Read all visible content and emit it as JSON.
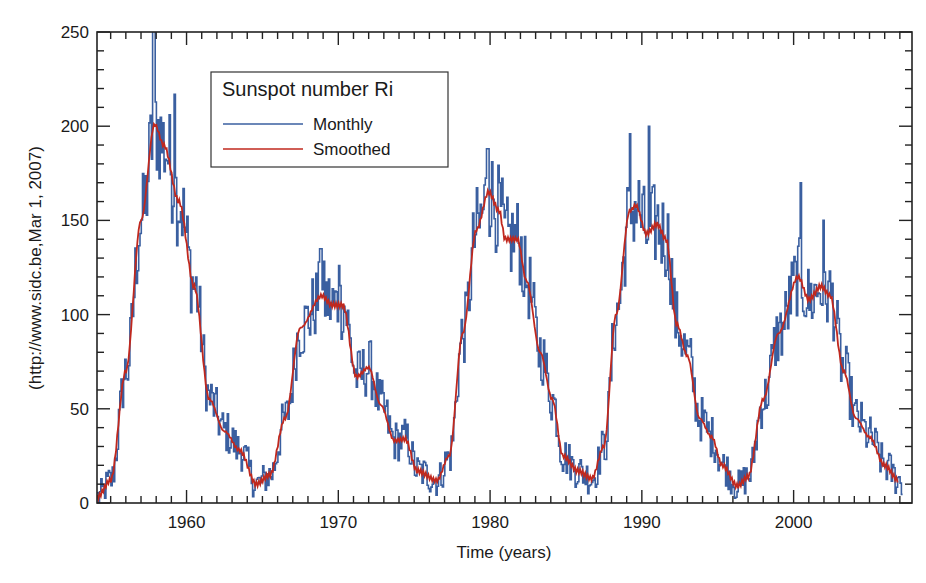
{
  "chart_data": {
    "type": "line",
    "title": "",
    "xlabel": "Time (years)",
    "ylabel": "(http://www.sidc.be,Mar 1, 2007)",
    "xlim": [
      1954.1,
      2007.8
    ],
    "ylim": [
      0,
      250
    ],
    "x_ticks": [
      1960,
      1970,
      1980,
      1990,
      2000
    ],
    "x_tick_labels": [
      "1960",
      "1970",
      "1980",
      "1990",
      "2000"
    ],
    "x_minor_step": 1,
    "y_ticks": [
      0,
      50,
      100,
      150,
      200,
      250
    ],
    "y_tick_labels": [
      "0",
      "50",
      "100",
      "150",
      "200",
      "250"
    ],
    "y_minor_step": 10,
    "grid": false,
    "legend": {
      "title": "Sunspot number Ri",
      "position": "upper-left-inset",
      "entries": [
        "Monthly",
        "Smoothed"
      ]
    },
    "series": [
      {
        "name": "Smoothed",
        "color": "#c0281e",
        "x": [
          1954.1,
          1955.0,
          1956.0,
          1957.0,
          1957.9,
          1958.5,
          1959.5,
          1960.5,
          1961.5,
          1962.5,
          1963.5,
          1964.6,
          1965.5,
          1966.5,
          1967.5,
          1968.9,
          1969.6,
          1970.3,
          1971.2,
          1972.0,
          1972.8,
          1973.7,
          1974.4,
          1975.2,
          1976.5,
          1977.3,
          1978.2,
          1979.1,
          1979.9,
          1980.6,
          1981.0,
          1981.8,
          1982.4,
          1983.3,
          1984.1,
          1984.8,
          1985.8,
          1986.7,
          1987.5,
          1988.3,
          1989.2,
          1989.6,
          1990.3,
          1991.0,
          1991.6,
          1992.3,
          1993.0,
          1993.8,
          1994.6,
          1995.3,
          1996.3,
          1997.0,
          1998.0,
          1999.0,
          2000.3,
          2001.0,
          2001.8,
          2002.4,
          2003.3,
          2004.1,
          2005.0,
          2006.0,
          2006.9
        ],
        "values": [
          3,
          12,
          70,
          150,
          201,
          190,
          160,
          115,
          55,
          38,
          28,
          10,
          15,
          45,
          93,
          110,
          105,
          105,
          67,
          72,
          52,
          33,
          34,
          17,
          12,
          25,
          90,
          145,
          165,
          155,
          140,
          140,
          118,
          80,
          55,
          25,
          17,
          13,
          30,
          100,
          155,
          158,
          143,
          148,
          140,
          95,
          78,
          45,
          35,
          20,
          9,
          14,
          55,
          90,
          120,
          108,
          115,
          110,
          70,
          45,
          35,
          20,
          12
        ]
      },
      {
        "name": "Monthly",
        "color": "#3a5fa0",
        "note": "Monthly values fluctuate around the smoothed curve; notable visible extremes listed",
        "peaks": [
          {
            "x": 1957.8,
            "y": 253
          },
          {
            "x": 1959.2,
            "y": 217
          },
          {
            "x": 1968.8,
            "y": 135
          },
          {
            "x": 1970.0,
            "y": 126
          },
          {
            "x": 1979.8,
            "y": 188
          },
          {
            "x": 1989.2,
            "y": 196
          },
          {
            "x": 1990.4,
            "y": 200
          },
          {
            "x": 2000.4,
            "y": 170
          },
          {
            "x": 2001.9,
            "y": 150
          }
        ],
        "noise_amplitude": 22
      }
    ]
  }
}
